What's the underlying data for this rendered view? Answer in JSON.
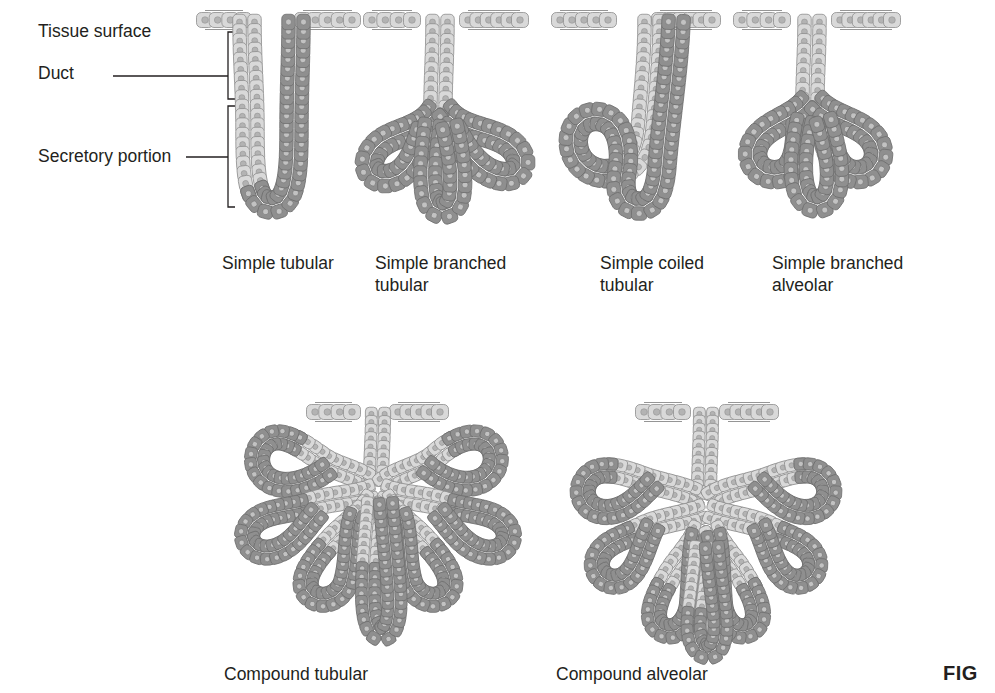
{
  "figure": {
    "figure_number": "FIG",
    "background_color": "#ffffff",
    "text_color": "#231f20"
  },
  "annotations": {
    "tissue_surface": "Tissue surface",
    "duct": "Duct",
    "secretory_portion": "Secretory portion"
  },
  "colors": {
    "duct_cell_fill": "#d9d9d9",
    "duct_cell_stroke": "#8d8d8d",
    "duct_nucleus": "#b3b3b3",
    "secretory_cell_fill": "#8f8f8f",
    "secretory_cell_stroke": "#6e6e6e",
    "secretory_nucleus": "#c2c2c2",
    "surface_cell_fill": "#dcdcdc",
    "leader_line": "#231f20"
  },
  "glands": [
    {
      "id": "simple-tubular",
      "caption": "Simple tubular",
      "row": "top",
      "duct_type": "simple",
      "secretory_shape": "straight tube"
    },
    {
      "id": "simple-branched-tubular",
      "caption": "Simple branched\ntubular",
      "row": "top",
      "duct_type": "simple",
      "secretory_shape": "three branched tubes"
    },
    {
      "id": "simple-coiled-tubular",
      "caption": "Simple coiled\ntubular",
      "row": "top",
      "duct_type": "simple",
      "secretory_shape": "coiled tube"
    },
    {
      "id": "simple-branched-alveolar",
      "caption": "Simple branched\nalveolar",
      "row": "top",
      "duct_type": "simple",
      "secretory_shape": "branched sacs"
    },
    {
      "id": "compound-tubular",
      "caption": "Compound tubular",
      "row": "bottom",
      "duct_type": "compound",
      "secretory_shape": "branched tubes"
    },
    {
      "id": "compound-alveolar",
      "caption": "Compound alveolar",
      "row": "bottom",
      "duct_type": "compound",
      "secretory_shape": "branched sacs"
    }
  ]
}
